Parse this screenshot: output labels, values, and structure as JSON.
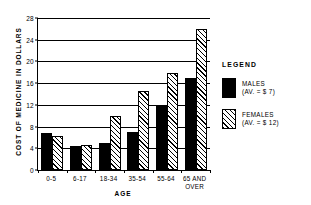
{
  "chart_data": {
    "type": "bar",
    "title": "",
    "xlabel": "AGE",
    "ylabel": "COST OF MEDICINE IN DOLLARS",
    "ylim": [
      0,
      28
    ],
    "yticks": [
      0,
      4,
      8,
      12,
      16,
      20,
      24,
      28
    ],
    "ytick_labels": [
      "0",
      "4",
      "8",
      "12",
      "16",
      "20",
      "24",
      "28"
    ],
    "grid": true,
    "grid_axis": "y",
    "legend_position": "right",
    "categories": [
      "0-5",
      "6-17",
      "18-34",
      "35-54",
      "55-64",
      "65 AND OVER"
    ],
    "category_lines": [
      [
        "0-5"
      ],
      [
        "6-17"
      ],
      [
        "18-34"
      ],
      [
        "35-54"
      ],
      [
        "55-64"
      ],
      [
        "65 AND",
        "OVER"
      ]
    ],
    "series": [
      {
        "name": "MALES",
        "key": "males",
        "color": "#000000",
        "fill": "solid",
        "values": [
          6.8,
          4.4,
          5.0,
          7.0,
          12.0,
          17.0
        ]
      },
      {
        "name": "FEMALES",
        "key": "females",
        "color": "#000000",
        "fill": "diagonal-hatch",
        "values": [
          6.2,
          4.6,
          10.0,
          14.5,
          17.8,
          26.0
        ]
      }
    ]
  },
  "legend": {
    "title": "LEGEND",
    "entries": [
      {
        "label": "MALES",
        "sub": "(AV. = $ 7)",
        "key": "males"
      },
      {
        "label": "FEMALES",
        "sub": "(AV. = $ 12)",
        "key": "females"
      }
    ]
  }
}
